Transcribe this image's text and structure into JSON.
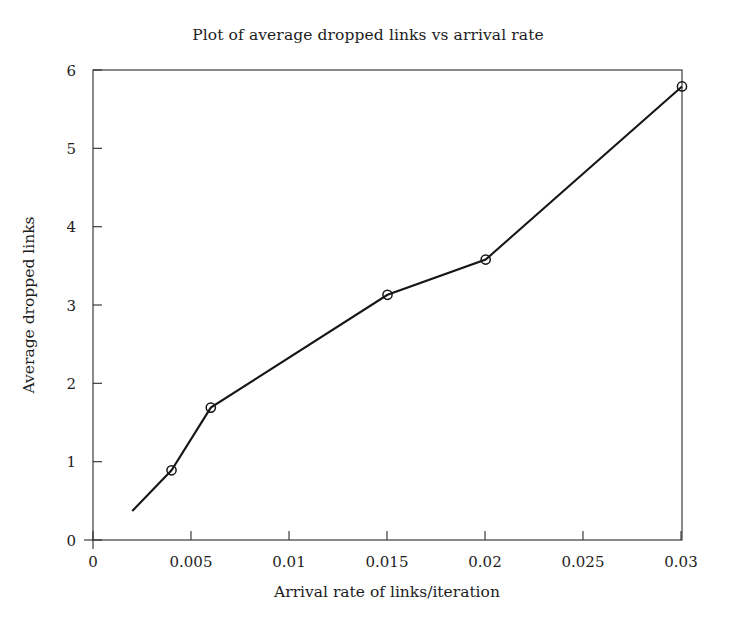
{
  "chart_data": {
    "type": "line",
    "title": "Plot of average dropped links vs arrival rate",
    "xlabel": "Arrival rate of links/iteration",
    "ylabel": "Average dropped links",
    "xlim": [
      0,
      0.03
    ],
    "ylim": [
      0,
      6
    ],
    "grid": false,
    "legend": null,
    "marker": "open-circle",
    "line_color": "#161616",
    "xticks": [
      0,
      0.005,
      0.01,
      0.015,
      0.02,
      0.025,
      0.03
    ],
    "xtick_labels": [
      "0",
      "0.005",
      "0.01",
      "0.015",
      "0.02",
      "0.025",
      "0.03"
    ],
    "yticks": [
      0,
      1,
      2,
      3,
      4,
      5,
      6
    ],
    "ytick_labels": [
      "0",
      "1",
      "2",
      "3",
      "4",
      "5",
      "6"
    ],
    "x": [
      0.002,
      0.004,
      0.006,
      0.015,
      0.02,
      0.03
    ],
    "y": [
      0.37,
      0.89,
      1.69,
      3.13,
      3.58,
      5.79
    ],
    "marker_x": [
      0.004,
      0.006,
      0.015,
      0.02,
      0.03
    ],
    "marker_y": [
      0.89,
      1.69,
      3.13,
      3.58,
      5.79
    ],
    "series": [
      {
        "name": "Average dropped links",
        "points": [
          {
            "x": 0.002,
            "y": 0.37,
            "marker": false
          },
          {
            "x": 0.004,
            "y": 0.89,
            "marker": true
          },
          {
            "x": 0.006,
            "y": 1.69,
            "marker": true
          },
          {
            "x": 0.015,
            "y": 3.13,
            "marker": true
          },
          {
            "x": 0.02,
            "y": 3.58,
            "marker": true
          },
          {
            "x": 0.03,
            "y": 5.79,
            "marker": true
          }
        ]
      }
    ]
  }
}
